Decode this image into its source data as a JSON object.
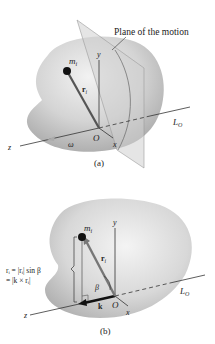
{
  "figure_a": {
    "plane_label": "Plane of the motion",
    "mass_label": "m",
    "mass_sub": "i",
    "r_label": "r",
    "r_sub": "i",
    "y_axis": "y",
    "x_axis": "x",
    "z_axis": "z",
    "origin": "O",
    "omega": "ω",
    "axis_label": "L",
    "axis_sub": "O",
    "caption": "(a)"
  },
  "figure_b": {
    "mass_label": "m",
    "mass_sub": "i",
    "r_label": "r",
    "r_sub": "i",
    "y_axis": "y",
    "x_axis": "x",
    "z_axis": "z",
    "origin": "O",
    "k_label": "k",
    "beta": "β",
    "axis_label": "L",
    "axis_sub": "O",
    "formula_line1": "rᵢ = |rᵢ| sin β",
    "formula_line2": "= |k × rᵢ|",
    "caption": "(b)"
  },
  "colors": {
    "body_fill": "#c9c9c9",
    "body_light": "#ececec",
    "plane_fill": "#d6d6d6",
    "line": "#333333",
    "rod": "#777777"
  }
}
